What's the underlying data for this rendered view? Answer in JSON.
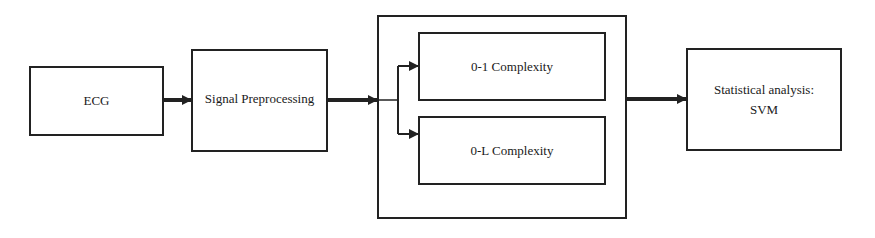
{
  "diagram": {
    "type": "flowchart",
    "nodes": [
      {
        "id": "ecg",
        "label": "ECG"
      },
      {
        "id": "preproc",
        "label": "Signal Preprocessing"
      },
      {
        "id": "c01",
        "label": "0-1 Complexity"
      },
      {
        "id": "c0l",
        "label": "0-L Complexity"
      },
      {
        "id": "svm",
        "label_line1": "Statistical analysis:",
        "label_line2": "SVM"
      }
    ],
    "group": {
      "id": "complexity-group",
      "contains": [
        "c01",
        "c0l"
      ]
    },
    "edges": [
      {
        "from": "ecg",
        "to": "preproc"
      },
      {
        "from": "preproc",
        "to": "complexity-group"
      },
      {
        "from": "complexity-group",
        "to": "c01"
      },
      {
        "from": "complexity-group",
        "to": "c0l"
      },
      {
        "from": "complexity-group",
        "to": "svm"
      }
    ],
    "colors": {
      "line": "#222222",
      "background": "#ffffff"
    }
  }
}
